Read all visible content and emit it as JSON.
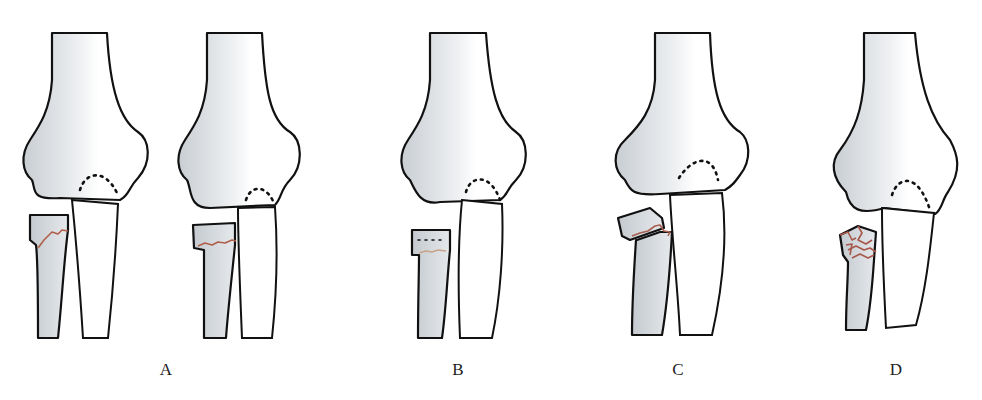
{
  "figure": {
    "panels": [
      {
        "id": "A",
        "label": "A",
        "views": 2,
        "description": "non-displaced crack through radial head/neck"
      },
      {
        "id": "B",
        "label": "B",
        "views": 1,
        "description": "radial neck fracture with slight displacement"
      },
      {
        "id": "C",
        "label": "C",
        "views": 1,
        "description": "angulated/tilted radial head fracture"
      },
      {
        "id": "D",
        "label": "D",
        "views": 1,
        "description": "comminuted radial head fracture"
      }
    ]
  },
  "colors": {
    "crack": "#b0604a",
    "outline": "#111111",
    "bone_shade": "#cfd4d8",
    "background": "#ffffff"
  }
}
